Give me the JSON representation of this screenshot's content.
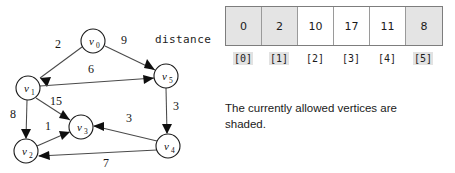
{
  "graph": {
    "nodes": [
      {
        "id": "v0",
        "label": "v",
        "subscript": "0",
        "cx": 93,
        "cy": 41,
        "r": 12
      },
      {
        "id": "v1",
        "label": "v",
        "subscript": "1",
        "cx": 28,
        "cy": 88,
        "r": 12
      },
      {
        "id": "v2",
        "label": "v",
        "subscript": "2",
        "cx": 26,
        "cy": 151,
        "r": 12
      },
      {
        "id": "v3",
        "label": "v",
        "subscript": "3",
        "cx": 81,
        "cy": 127,
        "r": 12
      },
      {
        "id": "v4",
        "label": "v",
        "subscript": "4",
        "cx": 168,
        "cy": 146,
        "r": 12
      },
      {
        "id": "v5",
        "label": "v",
        "subscript": "5",
        "cx": 166,
        "cy": 76,
        "r": 12
      }
    ],
    "edges": [
      {
        "from": "v0",
        "to": "v1",
        "weight": "2",
        "label_x": 58,
        "label_y": 48
      },
      {
        "from": "v0",
        "to": "v5",
        "weight": "9",
        "label_x": 124,
        "label_y": 44
      },
      {
        "from": "v1",
        "to": "v5",
        "weight": "6",
        "label_x": 91,
        "label_y": 73
      },
      {
        "from": "v1",
        "to": "v3",
        "weight": "15",
        "label_x": 56,
        "label_y": 105
      },
      {
        "from": "v1",
        "to": "v2",
        "weight": "8",
        "label_x": 13,
        "label_y": 118
      },
      {
        "from": "v2",
        "to": "v3",
        "weight": "1",
        "label_x": 48,
        "label_y": 130
      },
      {
        "from": "v5",
        "to": "v4",
        "weight": "3",
        "label_x": 176,
        "label_y": 110
      },
      {
        "from": "v4",
        "to": "v3",
        "weight": "3",
        "label_x": 129,
        "label_y": 122
      },
      {
        "from": "v4",
        "to": "v2",
        "weight": "7",
        "label_x": 106,
        "label_y": 167
      }
    ]
  },
  "array_panel": {
    "distance_label": "distance",
    "cells": [
      {
        "value": "0",
        "index": "[0]",
        "shaded": true
      },
      {
        "value": "2",
        "index": "[1]",
        "shaded": true
      },
      {
        "value": "10",
        "index": "[2]",
        "shaded": false
      },
      {
        "value": "17",
        "index": "[3]",
        "shaded": false
      },
      {
        "value": "11",
        "index": "[4]",
        "shaded": false
      },
      {
        "value": "8",
        "index": "[5]",
        "shaded": true
      }
    ],
    "caption": "The currently allowed vertices are shaded."
  },
  "colors": {
    "shade": "#e4e4e4",
    "border": "#7d7d7d",
    "edge": "#4a4a4a",
    "text": "#1a1a1a"
  }
}
